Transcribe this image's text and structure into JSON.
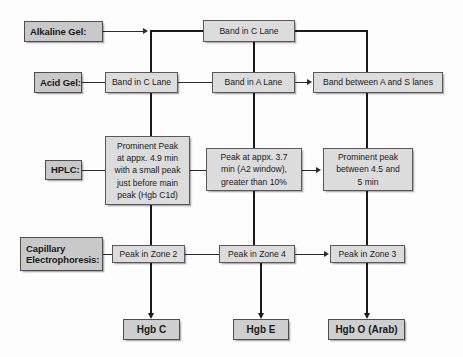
{
  "diagram": {
    "colors": {
      "node_fill": "#dcdcdc",
      "label_fill": "#c9c9c9",
      "result_fill": "#cfcfcf",
      "border": "#58585a",
      "line": "#2b2b2b",
      "background": "#fdfdfd"
    },
    "row_labels": [
      {
        "id": "alkaline-gel",
        "text": "Alkaline Gel:"
      },
      {
        "id": "acid-gel",
        "text": "Acid Gel:"
      },
      {
        "id": "hplc",
        "text": "HPLC:"
      },
      {
        "id": "capillary-electrophoresis",
        "line1": "Capillary",
        "line2": "Electrophoresis:"
      }
    ],
    "nodes": {
      "alkaline_band_c": "Band in C Lane",
      "acid_band_c": "Band in C Lane",
      "acid_band_a": "Band in A Lane",
      "acid_band_as": "Band between  A and S lanes",
      "hplc_c": {
        "l1": "Prominent Peak",
        "l2": "at appx. 4.9 min",
        "l3": "with a small peak",
        "l4": "just before  main",
        "l5": "peak (Hgb C1d)"
      },
      "hplc_e": {
        "l1": "Peak at appx. 3.7",
        "l2": "min (A2 window),",
        "l3": "greater than 10%"
      },
      "hplc_o": {
        "l1": "Prominent peak",
        "l2": "between  4.5 and",
        "l3": "5 min"
      },
      "ce_zone2": "Peak in Zone 2",
      "ce_zone4": "Peak in Zone 4",
      "ce_zone3": "Peak in Zone 3"
    },
    "results": [
      {
        "id": "hgb-c",
        "text": "Hgb C"
      },
      {
        "id": "hgb-e",
        "text": "Hgb E"
      },
      {
        "id": "hgb-o-arab",
        "text": "Hgb O (Arab)"
      }
    ]
  }
}
